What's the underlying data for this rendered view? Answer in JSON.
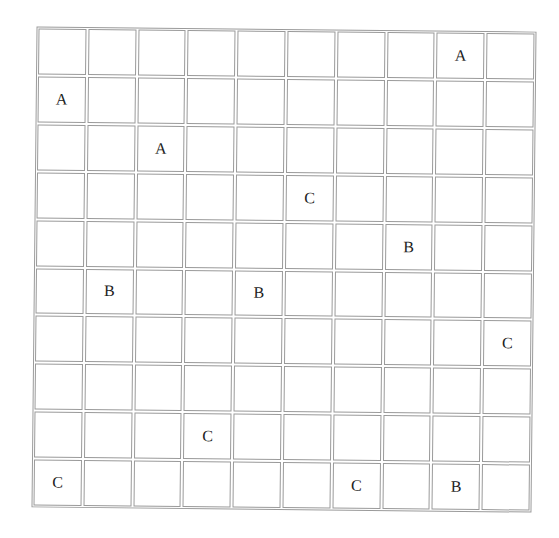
{
  "grid": {
    "rows": 10,
    "cols": 10,
    "cells": [
      [
        "",
        "",
        "",
        "",
        "",
        "",
        "",
        "",
        "A",
        ""
      ],
      [
        "A",
        "",
        "",
        "",
        "",
        "",
        "",
        "",
        "",
        ""
      ],
      [
        "",
        "",
        "A",
        "",
        "",
        "",
        "",
        "",
        "",
        ""
      ],
      [
        "",
        "",
        "",
        "",
        "",
        "C",
        "",
        "",
        "",
        ""
      ],
      [
        "",
        "",
        "",
        "",
        "",
        "",
        "",
        "B",
        "",
        ""
      ],
      [
        "",
        "B",
        "",
        "",
        "B",
        "",
        "",
        "",
        "",
        ""
      ],
      [
        "",
        "",
        "",
        "",
        "",
        "",
        "",
        "",
        "",
        "C"
      ],
      [
        "",
        "",
        "",
        "",
        "",
        "",
        "",
        "",
        "",
        ""
      ],
      [
        "",
        "",
        "",
        "C",
        "",
        "",
        "",
        "",
        "",
        ""
      ],
      [
        "C",
        "",
        "",
        "",
        "",
        "",
        "C",
        "",
        "B",
        ""
      ]
    ]
  }
}
